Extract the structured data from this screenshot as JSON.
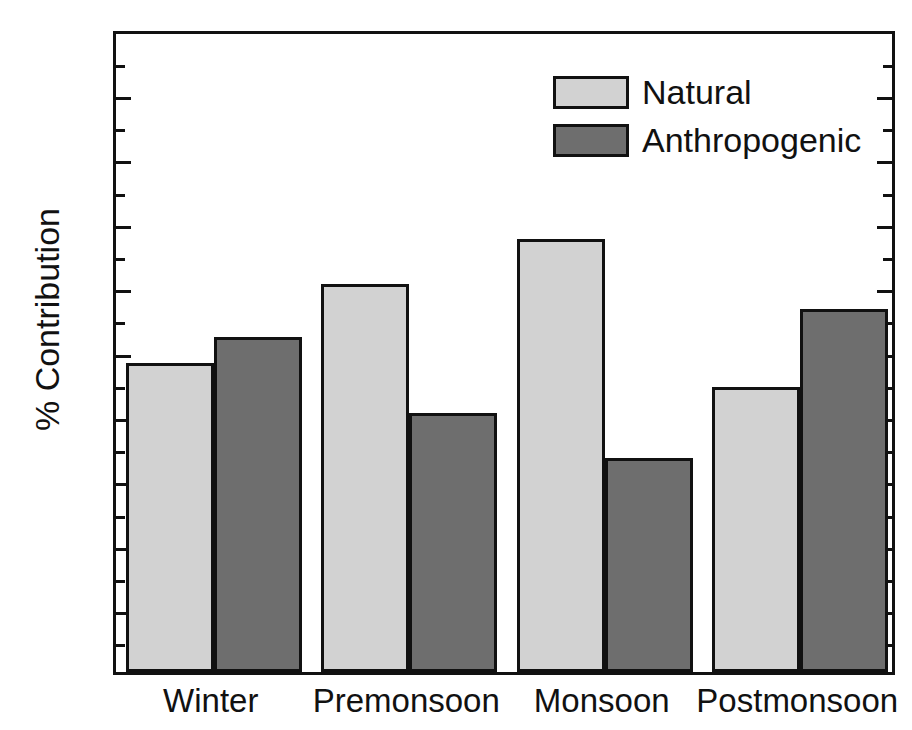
{
  "chart_data": {
    "type": "bar",
    "title": "",
    "subtitle": "",
    "xlabel": "",
    "ylabel": "% Contribution",
    "categories": [
      "Winter",
      "Premonsoon",
      "Monsoon",
      "Postmonsoon"
    ],
    "series": [
      {
        "name": "Natural",
        "color": "#d2d2d2",
        "values": [
          48.0,
          60.2,
          67.2,
          44.3
        ]
      },
      {
        "name": "Anthropogenic",
        "color": "#6e6e6e",
        "values": [
          52.0,
          40.2,
          33.3,
          56.3
        ]
      }
    ],
    "ylim": [
      0,
      100
    ],
    "y_major_ticks": [
      0,
      10,
      20,
      30,
      40,
      50,
      60,
      70,
      80,
      90,
      100
    ],
    "y_minor_ticks": [
      5,
      15,
      25,
      35,
      45,
      55,
      65,
      75,
      85,
      95
    ],
    "y_tick_labels": [
      "0",
      "10",
      "20",
      "30",
      "40",
      "50",
      "60",
      "70",
      "80",
      "90",
      "100"
    ],
    "grid": false,
    "legend_position": "top-center-right",
    "frame": "full-box",
    "tick_direction": "in",
    "axis_color": "#111111",
    "background": "#ffffff"
  },
  "legend": {
    "entries": [
      {
        "label": "Natural"
      },
      {
        "label": "Anthropogenic"
      }
    ]
  }
}
